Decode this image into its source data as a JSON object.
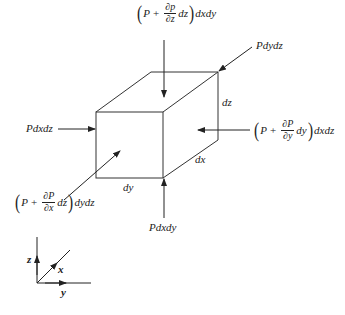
{
  "diagram": {
    "type": "fluid-element-pressure-forces",
    "colors": {
      "line": "#222222",
      "background": "#ffffff"
    },
    "cube": {
      "edge_labels": {
        "dx": "dx",
        "dy": "dy",
        "dz": "dz"
      }
    },
    "forces": {
      "top": {
        "open": "(",
        "P": "P",
        "plus": "+",
        "num": "∂p",
        "den": "∂z",
        "diff": "dz",
        "close": ")",
        "area": "dxdy"
      },
      "back_right": {
        "label": "Pdydz"
      },
      "left": {
        "label": "Pdxdz"
      },
      "right": {
        "open": "(",
        "P": "P",
        "plus": "+",
        "num": "∂P",
        "den": "∂y",
        "diff": "dy",
        "close": ")",
        "area": "dxdz"
      },
      "front_left": {
        "open": "(",
        "P": "P",
        "plus": "+",
        "num": "∂P",
        "den": "∂x",
        "diff": "dz",
        "close": ")",
        "area": "dydz"
      },
      "bottom": {
        "label": "Pdxdy"
      }
    },
    "axes": {
      "z": "z",
      "x": "x",
      "y": "y"
    }
  }
}
